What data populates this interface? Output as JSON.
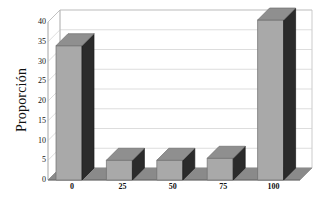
{
  "chart_data": {
    "type": "bar",
    "title": "",
    "xlabel": "",
    "ylabel": "Proporción",
    "categories": [
      "0",
      "25",
      "50",
      "75",
      "100"
    ],
    "values": [
      34,
      5,
      5,
      5.5,
      40.5
    ],
    "ylim": [
      0,
      40
    ],
    "yticks": [
      "0",
      "5",
      "10",
      "15",
      "20",
      "25",
      "30",
      "35",
      "40"
    ],
    "ytick_values": [
      0,
      5,
      10,
      15,
      20,
      25,
      30,
      35,
      40
    ],
    "xticks": [
      "0",
      "25",
      "50",
      "75",
      "100"
    ],
    "grid": "horizontal",
    "legend": "none",
    "style": "3d",
    "series": [
      {
        "name": "Proporción",
        "values": [
          34,
          5,
          5,
          5.5,
          40.5
        ]
      }
    ]
  },
  "colors": {
    "bar_front": "#a9a9a9",
    "bar_side": "#2b2b2b",
    "bar_top": "#8f8f8f",
    "floor": "#8a8a8a",
    "wall": "#ffffff",
    "grid": "#cfcfcf",
    "frame": "#b5b5b5",
    "axis_text": "#111111",
    "background": "#ffffff"
  },
  "geometry": {
    "plot_left": 48,
    "plot_right": 300,
    "baseline_y": 180,
    "top_y": 22,
    "depth_x": 12,
    "depth_y": 12,
    "bar_width": 26
  }
}
